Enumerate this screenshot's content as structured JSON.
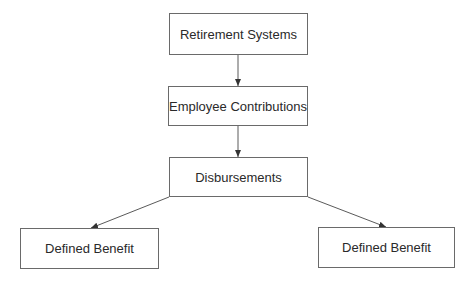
{
  "diagram": {
    "type": "flowchart",
    "nodes": [
      {
        "id": "retirement-systems",
        "label": "Retirement Systems",
        "x": 169,
        "y": 13,
        "w": 139,
        "h": 42
      },
      {
        "id": "employee-contributions",
        "label": "Employee Contributions",
        "x": 168,
        "y": 86,
        "w": 140,
        "h": 40
      },
      {
        "id": "disbursements",
        "label": "Disbursements",
        "x": 169,
        "y": 157,
        "w": 139,
        "h": 40
      },
      {
        "id": "defined-benefit-left",
        "label": "Defined Benefit",
        "x": 20,
        "y": 228,
        "w": 139,
        "h": 41
      },
      {
        "id": "defined-benefit-right",
        "label": "Defined Benefit",
        "x": 318,
        "y": 227,
        "w": 137,
        "h": 41
      }
    ],
    "edges": [
      {
        "from": "retirement-systems",
        "to": "employee-contributions",
        "x1": 238,
        "y1": 55,
        "x2": 238,
        "y2": 86
      },
      {
        "from": "employee-contributions",
        "to": "disbursements",
        "x1": 238,
        "y1": 126,
        "x2": 238,
        "y2": 157
      },
      {
        "from": "disbursements",
        "to": "defined-benefit-left",
        "x1": 169,
        "y1": 197,
        "x2": 91,
        "y2": 228
      },
      {
        "from": "disbursements",
        "to": "defined-benefit-right",
        "x1": 308,
        "y1": 197,
        "x2": 386,
        "y2": 227
      }
    ],
    "colors": {
      "stroke": "#5a5a5a",
      "border": "#6a6a6a",
      "text": "#2a2a2a",
      "background": "#ffffff"
    }
  }
}
